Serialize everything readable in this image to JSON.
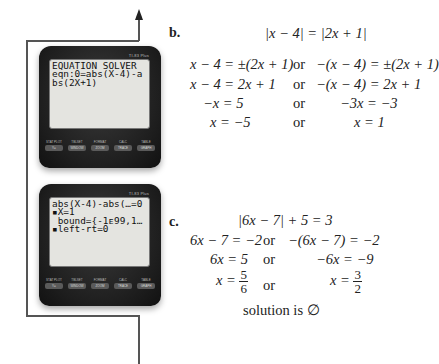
{
  "calculators": [
    {
      "brand": "TI-83 Plus",
      "screen_lines": [
        "EQUATION SOLVER",
        "eqn:0=abs(X-4)-a",
        "bs(2X+1)"
      ],
      "keys": [
        {
          "second": "STAT PLOT",
          "label": "Y="
        },
        {
          "second": "TBLSET",
          "label": "WINDOW"
        },
        {
          "second": "FORMAT",
          "label": "ZOOM"
        },
        {
          "second": "CALC",
          "label": "TRACE"
        },
        {
          "second": "TABLE",
          "label": "GRAPH"
        }
      ]
    },
    {
      "brand": "TI-83 Plus",
      "screen_lines": [
        "abs(X-4)-abs(…=0",
        "▪X=1",
        " bound={-1ᴇ99,1…",
        "▪left-rt=0"
      ],
      "keys": [
        {
          "second": "STAT PLOT",
          "label": "Y="
        },
        {
          "second": "TBLSET",
          "label": "WINDOW"
        },
        {
          "second": "FORMAT",
          "label": "ZOOM"
        },
        {
          "second": "CALC",
          "label": "TRACE"
        },
        {
          "second": "TABLE",
          "label": "GRAPH"
        }
      ]
    }
  ],
  "part_b": {
    "label": "b.",
    "equation": "|x − 4| = |2x + 1|",
    "rows": [
      {
        "left": "x − 4 = ±(2x + 1)",
        "or": "or",
        "right": "−(x − 4) = ±(2x + 1)"
      },
      {
        "left": "x − 4 = 2x + 1",
        "or": "or",
        "right": "−(x − 4) = 2x + 1"
      },
      {
        "left": "−x = 5",
        "or": "or",
        "right": "−3x = −3"
      },
      {
        "left": "x = −5",
        "or": "or",
        "right": "x = 1"
      }
    ]
  },
  "part_c": {
    "label": "c.",
    "equation": "|6x − 7| + 5 = 3",
    "rows": [
      {
        "left": "6x − 7 = −2",
        "or": "or",
        "right": "−(6x − 7) = −2"
      },
      {
        "left": "6x = 5",
        "or": "or",
        "right": "−6x = −9"
      }
    ],
    "fraction_row": {
      "left_var": "x =",
      "left_num": "5",
      "left_den": "6",
      "or": "or",
      "right_var": "x =",
      "right_num": "3",
      "right_den": "2"
    },
    "conclusion": "solution is ∅"
  }
}
